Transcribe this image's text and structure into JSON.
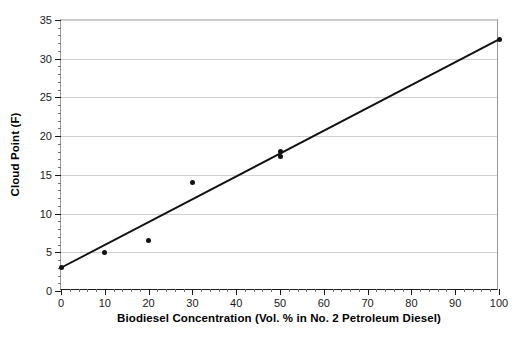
{
  "chart_data": {
    "type": "scatter",
    "title": "",
    "xlabel": "Biodiesel Concentration (Vol. % in No. 2 Petroleum Diesel)",
    "ylabel": "Cloud Point (F)",
    "xlim": [
      0,
      100
    ],
    "ylim": [
      0,
      35
    ],
    "xticks": [
      0,
      10,
      20,
      30,
      40,
      50,
      60,
      70,
      80,
      90,
      100
    ],
    "yticks": [
      0,
      5,
      10,
      15,
      20,
      25,
      30,
      35
    ],
    "x_minor_step": 2,
    "y_minor_step": 1,
    "grid": "horizontal-major",
    "legend": "none",
    "series": [
      {
        "name": "Measured cloud point",
        "marker": "filled-circle",
        "color": "#111111",
        "points": [
          {
            "x": 0,
            "y": 3
          },
          {
            "x": 10,
            "y": 5
          },
          {
            "x": 20,
            "y": 6.5
          },
          {
            "x": 30,
            "y": 14
          },
          {
            "x": 50,
            "y": 18
          },
          {
            "x": 50,
            "y": 17.4
          },
          {
            "x": 100,
            "y": 32.5
          }
        ]
      }
    ],
    "trendline": {
      "name": "Linear fit",
      "color": "#111111",
      "x_start": 0,
      "y_start": 3,
      "x_end": 100,
      "y_end": 32.5,
      "slope": 0.295,
      "intercept": 3
    }
  },
  "axes": {
    "x_tick_labels": [
      "0",
      "10",
      "20",
      "30",
      "40",
      "50",
      "60",
      "70",
      "80",
      "90",
      "100"
    ],
    "y_tick_labels": [
      "0",
      "5",
      "10",
      "15",
      "20",
      "25",
      "30",
      "35"
    ]
  },
  "colors": {
    "data": "#111111",
    "grid": "#cfcfcf",
    "frame": "#9a9a9a",
    "axis": "#1a1a1a",
    "background": "#ffffff"
  }
}
